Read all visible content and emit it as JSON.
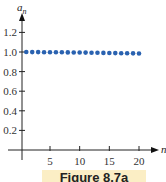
{
  "chart_data": {
    "type": "scatter",
    "title": "",
    "xlabel": "n",
    "ylabel": "a_n",
    "ylabel_display": "a",
    "ylabel_sub": "n",
    "x": [
      1,
      2,
      3,
      4,
      5,
      6,
      7,
      8,
      9,
      10,
      11,
      12,
      13,
      14,
      15,
      16,
      17,
      18,
      19,
      20
    ],
    "series": [
      {
        "name": "a_n",
        "color": "#2a62b0",
        "values": [
          1.0,
          0.999,
          0.999,
          0.998,
          0.998,
          0.997,
          0.997,
          0.996,
          0.995,
          0.995,
          0.994,
          0.993,
          0.992,
          0.991,
          0.99,
          0.989,
          0.988,
          0.987,
          0.986,
          0.985
        ]
      }
    ],
    "xticks": [
      5,
      10,
      15,
      20
    ],
    "xtick_labels": [
      "5",
      "10",
      "15",
      "20"
    ],
    "yticks": [
      0.2,
      0.4,
      0.6,
      0.8,
      1.0,
      1.2
    ],
    "ytick_labels": [
      "0.2",
      "0.4",
      "0.6",
      "0.8",
      "1.0",
      "1.2"
    ],
    "xlim": [
      0,
      22
    ],
    "ylim": [
      0,
      1.35
    ],
    "grid": false,
    "legend": null
  },
  "caption": "Figure 8.7a"
}
